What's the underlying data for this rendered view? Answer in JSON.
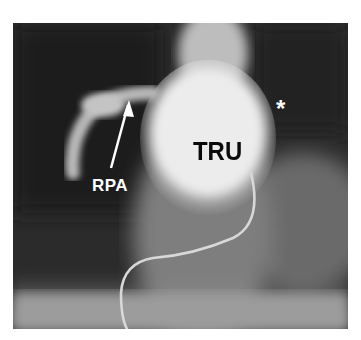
{
  "figure": {
    "type": "angiogram",
    "labels": {
      "rpa": "RPA",
      "tru": "TRU",
      "asterisk": "*"
    },
    "colors": {
      "background": "#ffffff",
      "dark_field": "#2a2a2a",
      "contrast_bright": "#f2f2f2",
      "label_white": "#ffffff",
      "label_black": "#0a0a0a"
    }
  }
}
